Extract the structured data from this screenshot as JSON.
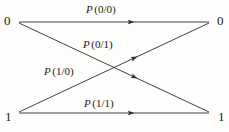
{
  "figure": {
    "type": "binary-channel-transition-diagram",
    "background_color": "#fdfdfb",
    "line_color": "#2a2a2a"
  },
  "nodes": {
    "input_top": "0",
    "input_bottom": "1",
    "output_top": "0",
    "output_bottom": "1"
  },
  "edges": [
    {
      "name": "edge-0-to-0",
      "from": "0",
      "to": "0",
      "label_var": "P",
      "label_args": "(0/0)"
    },
    {
      "name": "edge-1-to-0",
      "from": "1",
      "to": "0",
      "label_var": "P",
      "label_args": "(0/1)"
    },
    {
      "name": "edge-0-to-1",
      "from": "0",
      "to": "1",
      "label_var": "P",
      "label_args": "(1/0)"
    },
    {
      "name": "edge-1-to-1",
      "from": "1",
      "to": "1",
      "label_var": "P",
      "label_args": "(1/1)"
    }
  ]
}
